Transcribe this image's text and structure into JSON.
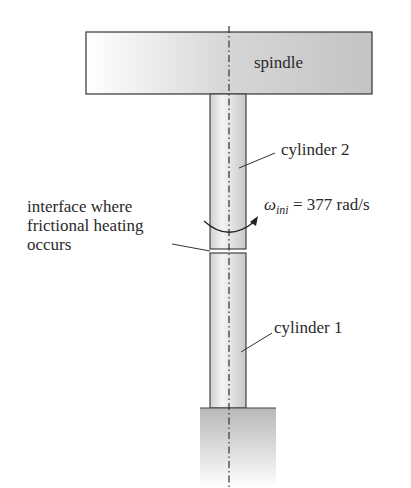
{
  "diagram": {
    "type": "schematic",
    "labels": {
      "spindle": "spindle",
      "cylinder2": "cylinder 2",
      "cylinder1": "cylinder 1",
      "interface_line1": "interface where",
      "interface_line2": "frictional heating",
      "interface_line3": "occurs",
      "omega_symbol": "ω",
      "omega_subscript": "ini",
      "omega_value": " = 377 rad/s"
    },
    "colors": {
      "outline": "#333333",
      "fill_light": "#f2f2f2",
      "fill_dark": "#bdbdbd",
      "axis": "#333333"
    }
  }
}
